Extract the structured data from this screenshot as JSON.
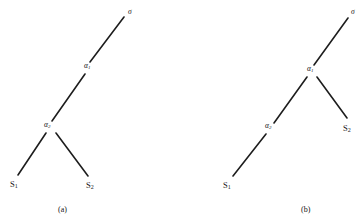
{
  "figure": {
    "background_color": "#ffffff",
    "line_color": "#1d1d1d",
    "text_color": "#141414",
    "width": 364,
    "height": 224
  },
  "panels": [
    {
      "id": "panel-a",
      "caption": "(a)",
      "caption_pos": {
        "x": 58,
        "y": 206
      },
      "nodes": [
        {
          "name": "root",
          "label_main": "σ",
          "label_sub": "",
          "x": 128,
          "y": 8,
          "anchor_x": 124,
          "anchor_y": 17
        },
        {
          "name": "alpha-1",
          "label_main": "α",
          "label_sub": "1",
          "x": 84,
          "y": 62,
          "anchor_x": 89,
          "anchor_y": 63
        },
        {
          "name": "alpha-2",
          "label_main": "α",
          "label_sub": "2",
          "x": 44,
          "y": 121,
          "anchor_x": 51,
          "anchor_y": 123
        },
        {
          "name": "leaf-s1",
          "label_main": "S",
          "label_sub": "1",
          "x": 10,
          "y": 180,
          "anchor_x": 18,
          "anchor_y": 178
        },
        {
          "name": "leaf-s2",
          "label_main": "S",
          "label_sub": "2",
          "x": 86,
          "y": 181,
          "anchor_x": 88,
          "anchor_y": 179
        }
      ],
      "edges": [
        {
          "name": "edge-root-alpha1",
          "x1": 124,
          "y1": 17,
          "x2": 90,
          "y2": 62
        },
        {
          "name": "edge-alpha1-alpha2",
          "x1": 85,
          "y1": 74,
          "x2": 52,
          "y2": 121
        },
        {
          "name": "edge-alpha2-s1",
          "x1": 46,
          "y1": 133,
          "x2": 18,
          "y2": 175
        },
        {
          "name": "edge-alpha2-s2",
          "x1": 56,
          "y1": 133,
          "x2": 88,
          "y2": 176
        }
      ]
    },
    {
      "id": "panel-b",
      "caption": "(b)",
      "caption_pos": {
        "x": 301,
        "y": 206
      },
      "nodes": [
        {
          "name": "root",
          "label_main": "σ",
          "label_sub": "",
          "x": 351,
          "y": 8,
          "anchor_x": 348,
          "anchor_y": 18
        },
        {
          "name": "alpha-1",
          "label_main": "α",
          "label_sub": "1",
          "x": 307,
          "y": 65,
          "anchor_x": 313,
          "anchor_y": 66
        },
        {
          "name": "alpha-2",
          "label_main": "α",
          "label_sub": "2",
          "x": 265,
          "y": 122,
          "anchor_x": 272,
          "anchor_y": 124
        },
        {
          "name": "leaf-s1",
          "label_main": "S",
          "label_sub": "1",
          "x": 223,
          "y": 181,
          "anchor_x": 231,
          "anchor_y": 179
        },
        {
          "name": "leaf-s2",
          "label_main": "S",
          "label_sub": "2",
          "x": 343,
          "y": 124,
          "anchor_x": 346,
          "anchor_y": 122
        }
      ],
      "edges": [
        {
          "name": "edge-root-alpha1",
          "x1": 348,
          "y1": 18,
          "x2": 314,
          "y2": 65
        },
        {
          "name": "edge-alpha1-alpha2",
          "x1": 307,
          "y1": 77,
          "x2": 274,
          "y2": 123
        },
        {
          "name": "edge-alpha1-s2",
          "x1": 317,
          "y1": 77,
          "x2": 347,
          "y2": 118
        },
        {
          "name": "edge-alpha2-s1",
          "x1": 266,
          "y1": 134,
          "x2": 233,
          "y2": 176
        }
      ]
    }
  ]
}
